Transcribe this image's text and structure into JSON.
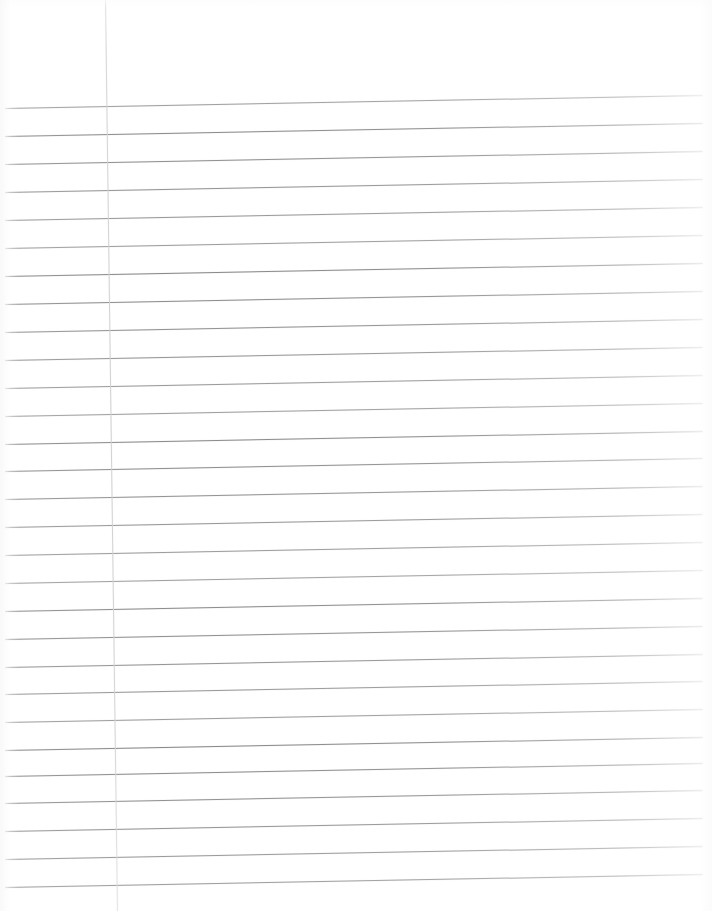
{
  "document": {
    "kind": "scanned-lined-paper",
    "title": "Lined Notebook Paper",
    "content_text": "",
    "page_width": 712,
    "page_height": 911,
    "background_color": "#ffffff"
  },
  "ruling": {
    "type": "wide-ruled-horizontal",
    "line_color": "#8a8a8a",
    "line_count": 29,
    "line_spacing_px": 28,
    "first_line_y": 108,
    "last_line_y": 887,
    "line_start_x": 5,
    "line_end_x": 703,
    "skew_rise_px": -13,
    "line_y_positions": [
      108,
      136,
      164,
      192,
      220,
      248,
      276,
      304,
      332,
      360,
      388,
      416,
      444,
      471,
      499,
      527,
      555,
      583,
      611,
      639,
      667,
      694,
      722,
      750,
      776,
      803,
      831,
      859,
      887
    ]
  },
  "margin": {
    "type": "vertical-margin-rule",
    "line_color": "#d2d2d2",
    "top_x": 105,
    "bottom_x": 117,
    "top_y": 0,
    "bottom_y": 911
  }
}
